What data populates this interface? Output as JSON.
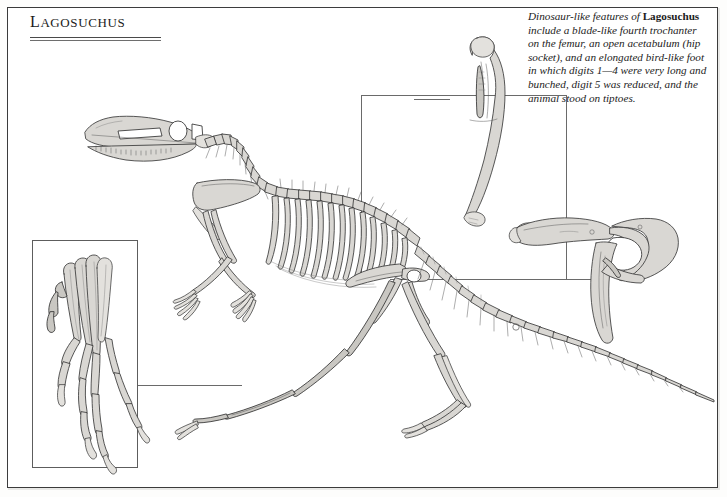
{
  "page": {
    "title": "Lagosuchus",
    "border_color": "#3b3b3b",
    "background": "#ffffff"
  },
  "caption": {
    "line_1": "Dinosaur-like features of",
    "genus": "Lagosuchus",
    "line_2": " include a blade-",
    "body": "like fourth trochanter on the femur, an open acetabulum (hip socket), and an elongated bird-like foot in which digits 1—4 were very long and bunched, digit 5 was reduced, and the animal stood on tiptoes."
  },
  "figure": {
    "main_label": "lagosuchus-skeleton-lateral",
    "insets": [
      {
        "name": "foot-inset",
        "label": "elongated bird-like foot, digits 1-4 bunched"
      },
      {
        "name": "femur-inset",
        "label": "femur with blade-like fourth trochanter"
      },
      {
        "name": "pelvis-inset",
        "label": "pelvis with open acetabulum"
      }
    ],
    "leaders": [
      {
        "name": "leader-foot",
        "from": "foot-inset",
        "to": "hind-foot"
      },
      {
        "name": "leader-femur",
        "from": "femur-inset",
        "to": "femur"
      },
      {
        "name": "leader-pelvis",
        "from": "pelvis-inset",
        "to": "hip"
      }
    ]
  },
  "colors": {
    "bone_fill": "#d9d7d3",
    "bone_outline": "#3a3a3a",
    "leader_line": "#6a6a6a",
    "rule": "#4a4a4a"
  }
}
